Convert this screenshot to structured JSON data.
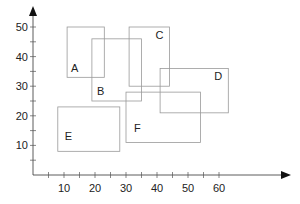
{
  "chart_data": {
    "type": "diagram",
    "title": "",
    "xlabel": "",
    "ylabel": "",
    "xlim": [
      0,
      80
    ],
    "ylim": [
      0,
      55
    ],
    "x_ticks": [
      10,
      20,
      30,
      40,
      50,
      60
    ],
    "x_minor_ticks": [
      5,
      15,
      25,
      35,
      45,
      55
    ],
    "y_ticks": [
      10,
      20,
      30,
      40,
      50
    ],
    "y_minor_ticks": [
      5,
      15,
      25,
      35,
      45
    ],
    "rectangles": [
      {
        "label": "A",
        "x0": 11,
        "x1": 23,
        "y0": 33,
        "y1": 50,
        "label_pos": "bottom-left"
      },
      {
        "label": "B",
        "x0": 19,
        "x1": 35,
        "y0": 25,
        "y1": 46,
        "label_pos": "bottom-left"
      },
      {
        "label": "C",
        "x0": 31,
        "x1": 44,
        "y0": 30,
        "y1": 50,
        "label_pos": "top-right"
      },
      {
        "label": "D",
        "x0": 41,
        "x1": 63,
        "y0": 21,
        "y1": 36,
        "label_pos": "top-right"
      },
      {
        "label": "E",
        "x0": 8,
        "x1": 28,
        "y0": 8,
        "y1": 23,
        "label_pos": "bottom-left"
      },
      {
        "label": "F",
        "x0": 30,
        "x1": 54,
        "y0": 11,
        "y1": 28,
        "label_pos": "bottom-left"
      }
    ],
    "grid": false,
    "legend": null
  },
  "colors": {
    "rect_stroke": "#999999",
    "axis": "#333333",
    "text": "#222222"
  }
}
